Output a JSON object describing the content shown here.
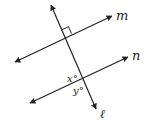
{
  "diagram": {
    "lines": {
      "m": {
        "label": "m",
        "from": [
          15,
          62
        ],
        "to": [
          112,
          16
        ]
      },
      "n": {
        "label": "n",
        "from": [
          30,
          103
        ],
        "to": [
          128,
          57
        ]
      },
      "l": {
        "label": "ℓ",
        "from": [
          51,
          5
        ],
        "to": [
          96,
          109
        ]
      }
    },
    "angles": {
      "x": {
        "label": "x°"
      },
      "y": {
        "label": "y°"
      }
    },
    "right_angle_marker": true,
    "colors": {
      "stroke": "#222222",
      "background": "#ffffff"
    }
  }
}
